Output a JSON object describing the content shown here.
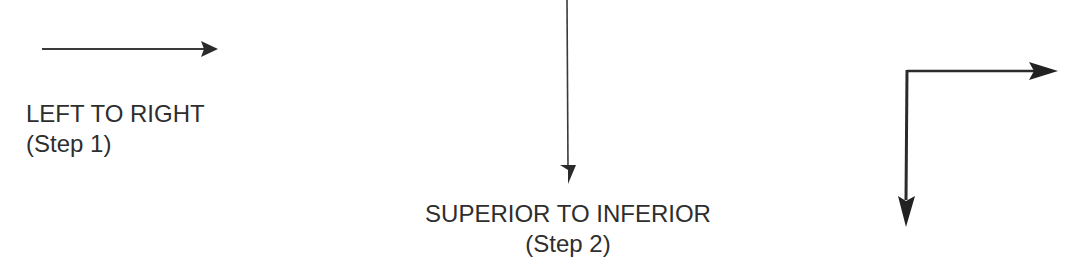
{
  "diagram": {
    "colors": {
      "ink": "#2b2b2b",
      "background": "#ffffff"
    },
    "steps": [
      {
        "title": "LEFT TO RIGHT",
        "subtitle": "(Step 1)",
        "arrow": "right-arrow"
      },
      {
        "title": "SUPERIOR TO INFERIOR",
        "subtitle": "(Step 2)",
        "arrow": "down-arrow"
      }
    ],
    "combined_arrow": "right-and-down-arrow"
  }
}
